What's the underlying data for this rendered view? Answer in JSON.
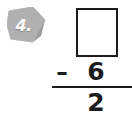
{
  "problem": {
    "number_label": "4.",
    "badge_icon": "pentagon-badge-icon",
    "badge_fill_color": "#b0b0b0",
    "badge_shadow_color": "#8f8f8f"
  },
  "equation": {
    "minuend_value": "",
    "minuend_placeholder": "",
    "operator": "–",
    "operator_name": "minus-sign",
    "subtrahend": "6",
    "difference": "2",
    "rule_color": "#1c1c1c",
    "digit_color": "#1c1c1c"
  },
  "page": {
    "background_color": "#ffffff"
  }
}
